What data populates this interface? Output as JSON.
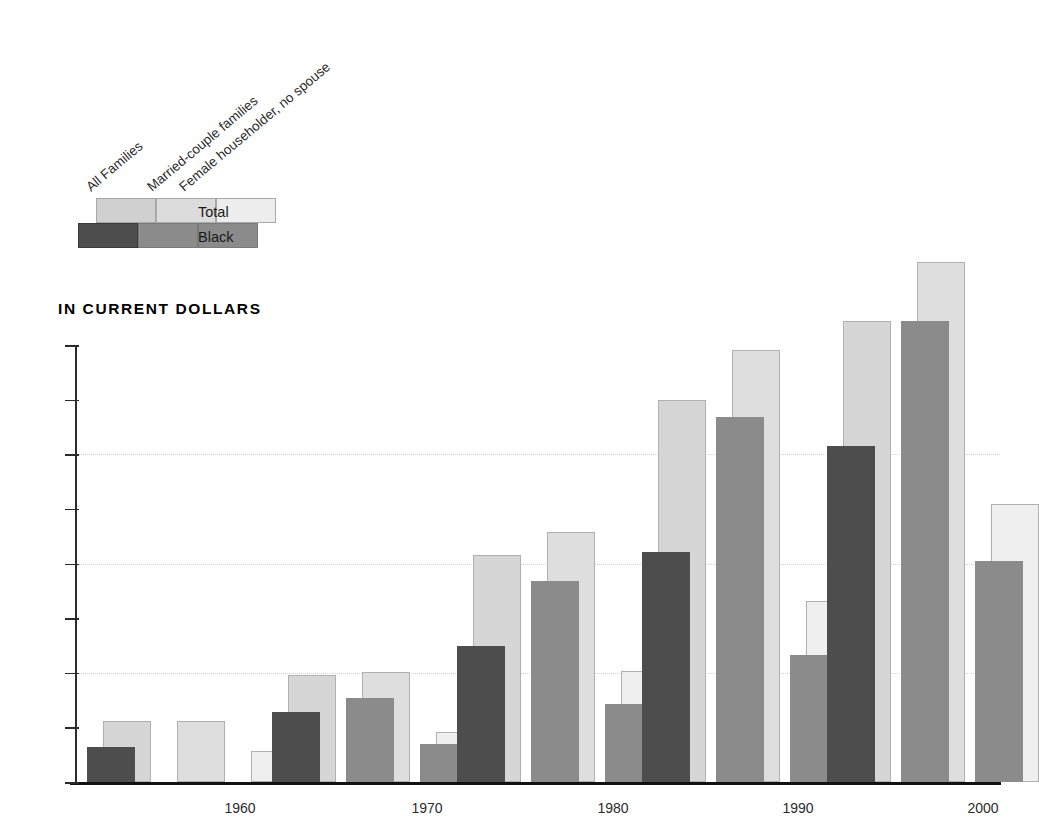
{
  "title": "IN CURRENT DOLLARS",
  "legend": {
    "category_labels": [
      "All Families",
      "Married-couple families",
      "Female householder, no spouse"
    ],
    "series_labels": [
      "Total",
      "Black"
    ],
    "swatch_colors_total": [
      "#d0d0d0",
      "#dcdcdc",
      "#ededed"
    ],
    "swatch_colors_black": [
      "#4d4d4d",
      "#8b8b8b",
      "#8b8b8b"
    ]
  },
  "colors": {
    "total_all": "#d6d6d6",
    "total_married": "#dedede",
    "total_female": "#efefef",
    "black_all": "#4d4d4d",
    "black_married": "#8b8b8b",
    "black_female": "#8b8b8b",
    "axis": "#111111",
    "grid": "#d2d2d2"
  },
  "chart_data": {
    "type": "bar",
    "title": "IN CURRENT DOLLARS",
    "xlabel": "",
    "ylabel": "",
    "ylim": [
      0,
      40000
    ],
    "yticks": [
      0,
      5000,
      10000,
      15000,
      20000,
      25000,
      30000,
      35000,
      40000
    ],
    "ytick_labels": [
      "0",
      "5000",
      "10000",
      "15000",
      "20000",
      "25000",
      "30000",
      "35000",
      "40000"
    ],
    "gridlines_at": [
      10000,
      20000,
      30000
    ],
    "grid": true,
    "legend_position": "top-left",
    "categories": [
      "1960",
      "1970",
      "1980",
      "1990",
      "2000"
    ],
    "groups": [
      "All Families",
      "Married-couple families",
      "Female householder, no spouse"
    ],
    "series": [
      {
        "name": "All Families - Total",
        "values": [
          5620,
          9820,
          20790,
          35010,
          42220
        ]
      },
      {
        "name": "All Families - Black",
        "values": [
          3230,
          6400,
          12430,
          21040,
          30790
        ]
      },
      {
        "name": "Married-couple families - Total",
        "values": [
          5620,
          10110,
          22890,
          39580,
          47560
        ]
      },
      {
        "name": "Married-couple families - Black",
        "values": [
          null,
          7730,
          18390,
          33400,
          42220
        ]
      },
      {
        "name": "Female householder, no spouse - Total",
        "values": [
          2880,
          4620,
          10160,
          16600,
          25470
        ]
      },
      {
        "name": "Female householder, no spouse - Black",
        "values": [
          null,
          3510,
          7180,
          11670,
          20200
        ]
      }
    ]
  },
  "bar_groups": [
    {
      "year": "1960",
      "x_center": 165,
      "bars": [
        {
          "name": "all-total",
          "value": 5620,
          "left": 28,
          "width": 48,
          "color": "#d6d6d6",
          "kind": "total"
        },
        {
          "name": "all-black",
          "value": 3230,
          "left": 12,
          "width": 48,
          "color": "#4d4d4d",
          "kind": "black"
        },
        {
          "name": "married-total",
          "value": 5620,
          "left": 102,
          "width": 48,
          "color": "#dedede",
          "kind": "total"
        },
        {
          "name": "female-total",
          "value": 2880,
          "left": 176,
          "width": 48,
          "color": "#efefef",
          "kind": "total"
        }
      ]
    },
    {
      "year": "1970",
      "x_center": 352,
      "bars": [
        {
          "name": "all-total",
          "value": 9820,
          "left": 213,
          "width": 48,
          "color": "#d6d6d6",
          "kind": "total"
        },
        {
          "name": "all-black",
          "value": 6400,
          "left": 197,
          "width": 48,
          "color": "#4d4d4d",
          "kind": "black"
        },
        {
          "name": "married-total",
          "value": 10110,
          "left": 287,
          "width": 48,
          "color": "#dedede",
          "kind": "total"
        },
        {
          "name": "married-black",
          "value": 7730,
          "left": 271,
          "width": 48,
          "color": "#8b8b8b",
          "kind": "black"
        },
        {
          "name": "female-total",
          "value": 4620,
          "left": 361,
          "width": 48,
          "color": "#efefef",
          "kind": "total"
        },
        {
          "name": "female-black",
          "value": 3510,
          "left": 345,
          "width": 48,
          "color": "#8b8b8b",
          "kind": "black"
        }
      ]
    },
    {
      "year": "1980",
      "x_center": 538,
      "bars": [
        {
          "name": "all-total",
          "value": 20790,
          "left": 398,
          "width": 48,
          "color": "#d6d6d6",
          "kind": "total"
        },
        {
          "name": "all-black",
          "value": 12430,
          "left": 382,
          "width": 48,
          "color": "#4d4d4d",
          "kind": "black"
        },
        {
          "name": "married-total",
          "value": 22890,
          "left": 472,
          "width": 48,
          "color": "#dedede",
          "kind": "total"
        },
        {
          "name": "married-black",
          "value": 18390,
          "left": 456,
          "width": 48,
          "color": "#8b8b8b",
          "kind": "black"
        },
        {
          "name": "female-total",
          "value": 10160,
          "left": 546,
          "width": 48,
          "color": "#efefef",
          "kind": "total"
        },
        {
          "name": "female-black",
          "value": 7180,
          "left": 530,
          "width": 48,
          "color": "#8b8b8b",
          "kind": "black"
        }
      ]
    },
    {
      "year": "1990",
      "x_center": 723,
      "bars": [
        {
          "name": "all-total",
          "value": 35010,
          "left": 583,
          "width": 48,
          "color": "#d6d6d6",
          "kind": "total"
        },
        {
          "name": "all-black",
          "value": 21040,
          "left": 567,
          "width": 48,
          "color": "#4d4d4d",
          "kind": "black"
        },
        {
          "name": "married-total",
          "value": 39580,
          "left": 657,
          "width": 48,
          "color": "#dedede",
          "kind": "total"
        },
        {
          "name": "married-black",
          "value": 33400,
          "left": 641,
          "width": 48,
          "color": "#8b8b8b",
          "kind": "black"
        },
        {
          "name": "female-total",
          "value": 16600,
          "left": 731,
          "width": 48,
          "color": "#efefef",
          "kind": "total"
        },
        {
          "name": "female-black",
          "value": 11670,
          "left": 715,
          "width": 48,
          "color": "#8b8b8b",
          "kind": "black"
        }
      ]
    },
    {
      "year": "2000",
      "x_center": 908,
      "bars": [
        {
          "name": "all-total",
          "value": 42220,
          "left": 768,
          "width": 48,
          "color": "#d6d6d6",
          "kind": "total"
        },
        {
          "name": "all-black",
          "value": 30790,
          "left": 752,
          "width": 48,
          "color": "#4d4d4d",
          "kind": "black"
        },
        {
          "name": "married-total",
          "value": 47560,
          "left": 842,
          "width": 48,
          "color": "#dedede",
          "kind": "total"
        },
        {
          "name": "married-black",
          "value": 42220,
          "left": 826,
          "width": 48,
          "color": "#8b8b8b",
          "kind": "black"
        },
        {
          "name": "female-total",
          "value": 25470,
          "left": 916,
          "width": 48,
          "color": "#efefef",
          "kind": "total"
        },
        {
          "name": "female-black",
          "value": 20200,
          "left": 900,
          "width": 48,
          "color": "#8b8b8b",
          "kind": "black"
        }
      ]
    }
  ]
}
